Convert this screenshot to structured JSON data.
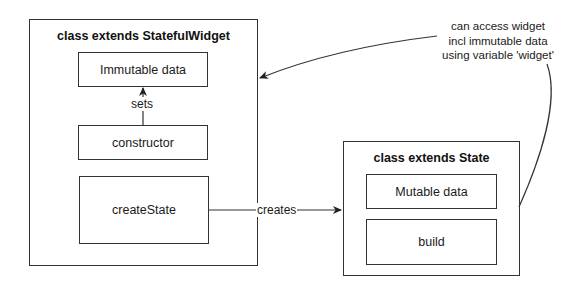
{
  "diagram": {
    "stateful_widget": {
      "title": "class extends StatefulWidget",
      "items": {
        "immutable_data": "Immutable data",
        "constructor": "constructor",
        "create_state": "createState"
      }
    },
    "state": {
      "title": "class extends State",
      "items": {
        "mutable_data": "Mutable data",
        "build": "build"
      }
    },
    "edges": {
      "sets": "sets",
      "creates": "creates"
    },
    "note": {
      "line1": "can access widget",
      "line2": "incl immutable data",
      "line3": "using variable 'widget'"
    },
    "colors": {
      "stroke": "#333333",
      "background": "#ffffff",
      "text": "#1a1a1a"
    }
  }
}
